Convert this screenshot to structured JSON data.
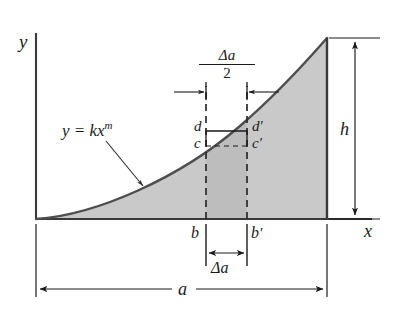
{
  "figure": {
    "type": "engineering-diagram",
    "background": "#ffffff",
    "ink_color": "#1a1a1a",
    "curve_color": "#4a4a4a",
    "fill_color": "#c9c9c9",
    "strip_fill_color": "#bdbdbd"
  },
  "axes": {
    "y_label": "y",
    "x_label": "x",
    "origin_x": 36,
    "origin_y": 219,
    "x_axis_end": 372,
    "y_axis_top": 33
  },
  "curve": {
    "equation_label": "y = kx",
    "equation_exponent": "m",
    "exponent_value": "m",
    "coefficient": "k",
    "form": "power",
    "m_estimate": 2,
    "start": [
      36,
      219
    ],
    "end": [
      327,
      38
    ]
  },
  "region": {
    "right_boundary_x": 327,
    "top_of_right_boundary_y": 38,
    "baseline_y": 219
  },
  "element": {
    "left_x": 206,
    "right_x": 247,
    "top_solid_y": 131,
    "mid_dashed_y": 146,
    "label_d": "d",
    "label_c": "c",
    "label_d_prime": "d",
    "label_c_prime": "c",
    "prime_mark": "′"
  },
  "dimensions": {
    "height": {
      "label": "h",
      "orientation": "vertical",
      "x": 355,
      "top_y": 38,
      "bottom_y": 219
    },
    "width_total": {
      "label": "a",
      "orientation": "horizontal",
      "y": 289,
      "left_x": 36,
      "right_x": 327
    },
    "delta_a": {
      "label": "Δa",
      "orientation": "horizontal",
      "y": 253,
      "left_x": 206,
      "right_x": 247
    },
    "half_delta_a": {
      "numerator": "Δa",
      "denominator": "2",
      "orientation": "horizontal",
      "y": 92,
      "left_x": 206,
      "right_x": 247
    }
  },
  "base_labels": {
    "b": "b",
    "b_prime": "b",
    "prime_mark": "′"
  }
}
